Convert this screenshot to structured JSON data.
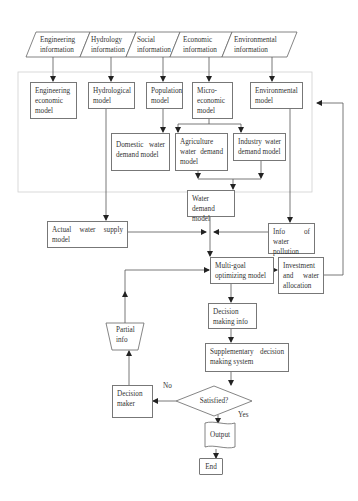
{
  "diagram": {
    "type": "flowchart",
    "inputs": [
      {
        "id": "engineering-info",
        "label": "Engineering information"
      },
      {
        "id": "hydrology-info",
        "label": "Hydrology information"
      },
      {
        "id": "social-info",
        "label": "Social information"
      },
      {
        "id": "economic-info",
        "label": "Economic information"
      },
      {
        "id": "environmental-info",
        "label": "Environmental information"
      }
    ],
    "models": {
      "engineering_economic": "Engineering economic model",
      "hydrological": "Hydrological model",
      "population": "Population model",
      "micro_economic": "Micro-economic model",
      "environmental": "Environmental model",
      "domestic_water_demand": "Domestic water demand model",
      "agriculture_water_demand": "Agriculture water demand model",
      "industry_water_demand": "Industry water demand model",
      "water_demand": "Water demand model",
      "actual_water_supply": "Actual water supply model",
      "info_water_pollution": "Info of water pollution",
      "multi_goal": "Multi-goal optimizing model",
      "investment": "Investment and water allocation",
      "decision_making_info": "Decision making info",
      "partial_info": "Partial info",
      "supplementary": "Supplementary decision making system",
      "decision_maker": "Decision maker",
      "satisfied": "Satisfied?",
      "output": "Output",
      "end": "End"
    },
    "edge_labels": {
      "no": "No",
      "yes": "Yes"
    },
    "edges": [
      [
        "Engineering information",
        "Engineering economic model"
      ],
      [
        "Hydrology information",
        "Hydrological model"
      ],
      [
        "Social information",
        "Population model"
      ],
      [
        "Economic information",
        "Micro-economic model"
      ],
      [
        "Environmental information",
        "Environmental model"
      ],
      [
        "Population model",
        "Domestic water demand model"
      ],
      [
        "Micro-economic model",
        "Agriculture water demand model"
      ],
      [
        "Micro-economic model",
        "Industry water demand model"
      ],
      [
        "Agriculture water demand model",
        "Water demand model"
      ],
      [
        "Industry water demand model",
        "Water demand model"
      ],
      [
        "Hydrological model",
        "Actual water supply model"
      ],
      [
        "Environmental model",
        "Info of water pollution"
      ],
      [
        "Water demand model",
        "Multi-goal optimizing model"
      ],
      [
        "Actual water supply model",
        "Multi-goal optimizing model"
      ],
      [
        "Info of water pollution",
        "Multi-goal optimizing model"
      ],
      [
        "Multi-goal optimizing model",
        "Investment and water allocation"
      ],
      [
        "Investment and water allocation",
        "Model group (feedback)"
      ],
      [
        "Multi-goal optimizing model",
        "Decision making info"
      ],
      [
        "Decision making info",
        "Supplementary decision making system"
      ],
      [
        "Supplementary decision making system",
        "Satisfied?"
      ],
      [
        "Satisfied?",
        "Decision maker",
        "No"
      ],
      [
        "Decision maker",
        "Partial info"
      ],
      [
        "Partial info",
        "Multi-goal optimizing model"
      ],
      [
        "Satisfied?",
        "Output",
        "Yes"
      ],
      [
        "Output",
        "End"
      ]
    ],
    "colors": {
      "stroke": "#777777",
      "container": "#cccccc",
      "text": "#333333"
    }
  }
}
